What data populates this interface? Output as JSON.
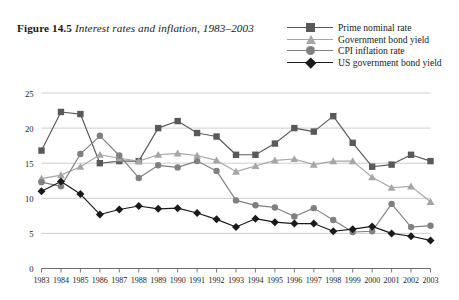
{
  "figure": {
    "label": "Figure 14.5",
    "caption": "Interest rates and inflation, 1983–2003"
  },
  "legend": {
    "position": "top-right",
    "items": [
      {
        "label": "Prime nominal rate",
        "marker": "square",
        "color": "#595959"
      },
      {
        "label": "Government bond yield",
        "marker": "triangle",
        "color": "#a6a6a6"
      },
      {
        "label": "CPI inflation rate",
        "marker": "circle",
        "color": "#808080"
      },
      {
        "label": "US government bond yield",
        "marker": "diamond",
        "color": "#1a1a1a"
      }
    ]
  },
  "chart_data": {
    "type": "line",
    "xlabel": "",
    "ylabel": "",
    "grid": true,
    "legend_position": "top-right",
    "ylim": [
      0,
      25
    ],
    "yticks": [
      0,
      5,
      10,
      15,
      20,
      25
    ],
    "xlim": [
      1983,
      2003
    ],
    "categories": [
      "1983",
      "1984",
      "1985",
      "1986",
      "1987",
      "1988",
      "1989",
      "1990",
      "1991",
      "1992",
      "1993",
      "1994",
      "1995",
      "1996",
      "1997",
      "1998",
      "1999",
      "2000",
      "2001",
      "2002",
      "2003"
    ],
    "series": [
      {
        "name": "Prime nominal rate",
        "marker": "square",
        "color": "#595959",
        "values": [
          16.8,
          22.3,
          22.0,
          15.0,
          15.3,
          15.3,
          20.0,
          21.0,
          19.3,
          18.8,
          16.2,
          16.2,
          17.8,
          20.0,
          19.5,
          21.7,
          17.9,
          14.5,
          14.8,
          16.2,
          15.3
        ]
      },
      {
        "name": "Government bond yield",
        "marker": "triangle",
        "color": "#a6a6a6",
        "values": [
          12.8,
          13.3,
          14.5,
          16.2,
          15.7,
          15.3,
          16.2,
          16.4,
          16.1,
          15.4,
          13.8,
          14.6,
          15.4,
          15.6,
          14.8,
          15.3,
          15.3,
          13.0,
          11.5,
          11.7,
          9.5
        ]
      },
      {
        "name": "CPI inflation rate",
        "marker": "circle",
        "color": "#808080",
        "values": [
          12.3,
          11.7,
          16.3,
          18.9,
          16.1,
          12.9,
          14.7,
          14.4,
          15.3,
          13.9,
          9.7,
          9.0,
          8.7,
          7.4,
          8.6,
          6.9,
          5.2,
          5.3,
          9.2,
          5.9,
          6.1
        ]
      },
      {
        "name": "US government bond yield",
        "marker": "diamond",
        "color": "#1a1a1a",
        "values": [
          11.0,
          12.4,
          10.6,
          7.7,
          8.4,
          8.9,
          8.5,
          8.6,
          7.9,
          7.0,
          5.9,
          7.1,
          6.6,
          6.4,
          6.4,
          5.3,
          5.6,
          6.0,
          5.0,
          4.6,
          4.0
        ]
      }
    ]
  },
  "axes": {
    "y_tick_labels": [
      "25",
      "20",
      "15",
      "10",
      "5",
      "0"
    ],
    "x_tick_labels": [
      "1983",
      "1984",
      "1985",
      "1986",
      "1987",
      "1988",
      "1989",
      "1990",
      "1991",
      "1992",
      "1993",
      "1994",
      "1995",
      "1996",
      "1997",
      "1998",
      "1999",
      "2000",
      "2001",
      "2002",
      "2003"
    ]
  },
  "colors": {
    "background": "#ffffff",
    "grid": "#c8c8c8",
    "axis": "#6b6b6b",
    "text": "#1a1a1a"
  }
}
